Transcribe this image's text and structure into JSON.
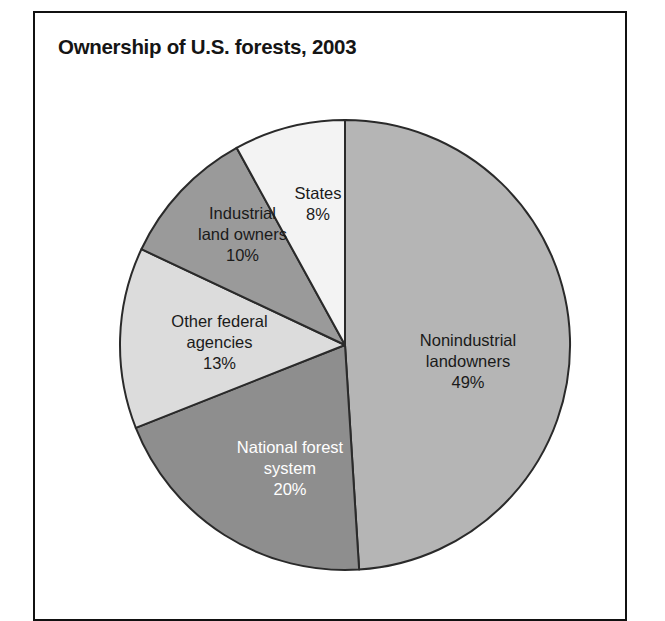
{
  "figure": {
    "title": "Ownership of U.S. forests, 2003",
    "border_color": "#111111",
    "background": "#ffffff"
  },
  "chart_data": {
    "type": "pie",
    "title": "Ownership of U.S. forests, 2003",
    "xlabel": "",
    "ylabel": "",
    "legend": "none",
    "grid": false,
    "units": "percent",
    "start_angle_deg": 0,
    "direction": "clockwise",
    "categories": [
      "Nonindustrial landowners",
      "National forest system",
      "Other federal agencies",
      "Industrial land owners",
      "States"
    ],
    "values": [
      49,
      20,
      13,
      10,
      8
    ],
    "slices": [
      {
        "label": "Nonindustrial landowners",
        "label_line1": "Nonindustrial",
        "label_line2": "landowners",
        "value": 49,
        "value_text": "49%",
        "color": "#b5b5b5",
        "text_color": "#1a1a1a"
      },
      {
        "label": "National forest system",
        "label_line1": "National forest",
        "label_line2": "system",
        "value": 20,
        "value_text": "20%",
        "color": "#8e8e8e",
        "text_color": "#ffffff"
      },
      {
        "label": "Other federal agencies",
        "label_line1": "Other federal",
        "label_line2": "agencies",
        "value": 13,
        "value_text": "13%",
        "color": "#dcdcdc",
        "text_color": "#1a1a1a"
      },
      {
        "label": "Industrial land owners",
        "label_line1": "Industrial",
        "label_line2": "land owners",
        "value": 10,
        "value_text": "10%",
        "color": "#9a9a9a",
        "text_color": "#1a1a1a"
      },
      {
        "label": "States",
        "label_line1": "States",
        "label_line2": "",
        "value": 8,
        "value_text": "8%",
        "color": "#f3f3f3",
        "text_color": "#1a1a1a"
      }
    ]
  }
}
